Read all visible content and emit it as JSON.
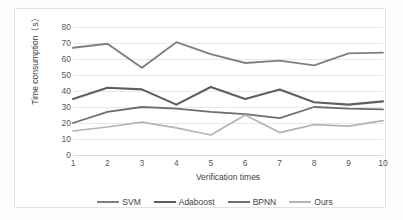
{
  "chart_data": {
    "type": "line",
    "title": "",
    "xlabel": "Verification times",
    "ylabel": "Time consumption（s）",
    "categories": [
      "1",
      "2",
      "3",
      "4",
      "5",
      "6",
      "7",
      "8",
      "9",
      "10"
    ],
    "x": [
      1,
      2,
      3,
      4,
      5,
      6,
      7,
      8,
      9,
      10
    ],
    "xlim": [
      1,
      10
    ],
    "ylim": [
      0,
      80
    ],
    "yticks": [
      80,
      70,
      60,
      50,
      40,
      30,
      20,
      10,
      0
    ],
    "grid": true,
    "legend_position": "bottom",
    "series": [
      {
        "name": "SVM",
        "color": "#808080",
        "width": 1.9,
        "values": [
          67,
          69.5,
          54.5,
          70.5,
          63,
          57.5,
          59,
          56,
          63.5,
          64
        ]
      },
      {
        "name": "Adaboost",
        "color": "#5f5f5f",
        "width": 2.1,
        "values": [
          35,
          42,
          41,
          31.5,
          42.5,
          35,
          41,
          33,
          31.5,
          33.5
        ]
      },
      {
        "name": "BPNN",
        "color": "#6e6e6e",
        "width": 1.8,
        "values": [
          20,
          27,
          30,
          29,
          27,
          25.5,
          23,
          30,
          29,
          28.5
        ]
      },
      {
        "name": "Ours",
        "color": "#b4b4b4",
        "width": 1.7,
        "values": [
          15,
          17.5,
          20.5,
          17,
          12.5,
          25,
          14,
          19,
          18,
          21.5
        ]
      }
    ]
  },
  "colors": {
    "background": "#ffffff",
    "frame_border": "#e2e2e2",
    "gridline": "#e8e8e8",
    "tick_text": "#595959",
    "axis_title_text": "#3f3f3f"
  }
}
